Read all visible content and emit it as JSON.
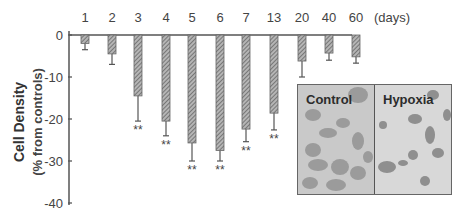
{
  "chart_data": {
    "type": "bar",
    "title": "",
    "xlabel": "(days)",
    "ylabel": "Cell Density",
    "ylabel_sub": "(% from controls)",
    "categories": [
      "1",
      "2",
      "3",
      "4",
      "5",
      "6",
      "7",
      "13",
      "20",
      "40",
      "60"
    ],
    "series": [
      {
        "name": "Cell Density change",
        "values": [
          -2,
          -4.5,
          -14.5,
          -20.5,
          -25.7,
          -27.5,
          -22.4,
          -18.6,
          -6.2,
          -4.3,
          -5.2
        ],
        "error": [
          1.5,
          2.5,
          6,
          3.5,
          4.3,
          2.5,
          3,
          4,
          3.8,
          1.7,
          1.5
        ],
        "significance": [
          "",
          "",
          "**",
          "**",
          "**",
          "**",
          "**",
          "**",
          "",
          "",
          ""
        ]
      }
    ],
    "yticks": [
      0,
      -10,
      -20,
      -30,
      -40
    ],
    "ylim": [
      -40,
      0
    ],
    "grid": false,
    "legend": null,
    "bar_fill": "hatched grey"
  },
  "axis": {
    "x_unit_label": "(days)",
    "y_title": "Cell Density",
    "y_subtitle": "(% from controls)",
    "ytick_labels": [
      "0",
      "-10",
      "-20",
      "-30",
      "-40"
    ]
  },
  "inset": {
    "left_label": "Control",
    "right_label": "Hypoxia"
  },
  "colors": {
    "axis": "#555555",
    "bar": "#8a8a8a",
    "text": "#333333"
  }
}
